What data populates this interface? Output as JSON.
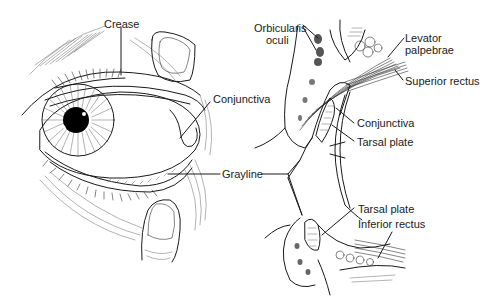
{
  "figure": {
    "left_panel": {
      "title": "External eye view with everted lids",
      "labels": {
        "crease": "Crease",
        "conjunctiva": "Conjunctiva",
        "grayline": "Grayline"
      }
    },
    "right_panel": {
      "title": "Sagittal section of eyelids",
      "labels": {
        "orbicularis_1": "Orbicularis",
        "orbicularis_2": "oculi",
        "levator_1": "Levator",
        "levator_2": "palpebrae",
        "superior_rectus": "Superior rectus",
        "conjunctiva": "Conjunctiva",
        "tarsal_plate_upper": "Tarsal plate",
        "tarsal_plate_lower": "Tarsal plate",
        "inferior_rectus": "Inferior rectus"
      }
    },
    "colors": {
      "ink": "#1a1a1a",
      "background": "#ffffff",
      "pupil": "#000000"
    }
  }
}
